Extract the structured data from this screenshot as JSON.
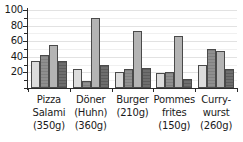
{
  "chart_data": {
    "type": "bar",
    "title": "",
    "subtitle": "",
    "xlabel": "",
    "ylabel": "",
    "ylim": [
      0,
      100
    ],
    "yticks": [
      20,
      40,
      60,
      80,
      100
    ],
    "ytick_labels": [
      "20",
      "40",
      "60",
      "80",
      "100"
    ],
    "minor_ytick_step": 10,
    "grid": true,
    "grid_axis": "y",
    "legend": false,
    "legend_position": "none",
    "grouped": true,
    "categories": [
      "Pizza Salami (350g)",
      "Döner (Huhn) (360g)",
      "Burger (210g)",
      "Pommes frites (150g)",
      "Currywurst (260g)"
    ],
    "category_lines": [
      [
        "Pizza",
        "Salami",
        "(350g)"
      ],
      [
        "Döner",
        "(Huhn)",
        "(360g)"
      ],
      [
        "Burger",
        "(210g)"
      ],
      [
        "Pommes",
        "frites",
        "(150g)"
      ],
      [
        "Curry-",
        "wurst",
        "(260g)"
      ]
    ],
    "series": [
      {
        "name": "series-1",
        "color": "#dcdcdc",
        "values": [
          35,
          24,
          20,
          19,
          30
        ]
      },
      {
        "name": "series-2",
        "color": "#8f8f8f",
        "values": [
          42,
          9,
          24,
          21,
          50
        ]
      },
      {
        "name": "series-3",
        "color": "#b4b4b4",
        "values": [
          55,
          90,
          73,
          67,
          47
        ]
      },
      {
        "name": "series-4",
        "color": "#6e6e6e",
        "values": [
          35,
          29,
          26,
          11,
          25
        ]
      }
    ]
  },
  "colors": {
    "axis": "#2b2b2b",
    "gridline": "#e2e2e2",
    "gridline_minor": "#f0f0f0",
    "background": "#ffffff",
    "bar_edge": "#4a4a4a"
  }
}
